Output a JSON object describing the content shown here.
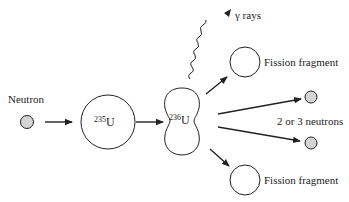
{
  "diagram": {
    "colors": {
      "stroke": "#222222",
      "neutron_fill": "#d4d4d4",
      "background": "#ffffff"
    },
    "nodes": {
      "incoming_neutron": {
        "label": "Neutron"
      },
      "u235": {
        "mass_number": "235",
        "symbol": "U"
      },
      "u236": {
        "mass_number": "236",
        "symbol": "U"
      },
      "gamma": {
        "label": "γ rays"
      },
      "fragment_top": {
        "label": "Fission fragment"
      },
      "fragment_bottom": {
        "label": "Fission fragment"
      },
      "neutrons_out": {
        "label": "2 or 3 neutrons"
      }
    },
    "edges": [
      {
        "from": "incoming_neutron",
        "to": "u235"
      },
      {
        "from": "u235",
        "to": "u236"
      },
      {
        "from": "u236",
        "to": "gamma",
        "style": "wavy"
      },
      {
        "from": "u236",
        "to": "fragment_top"
      },
      {
        "from": "u236",
        "to": "fragment_bottom"
      },
      {
        "from": "u236",
        "to": "neutron_out_1"
      },
      {
        "from": "u236",
        "to": "neutron_out_2"
      }
    ]
  }
}
